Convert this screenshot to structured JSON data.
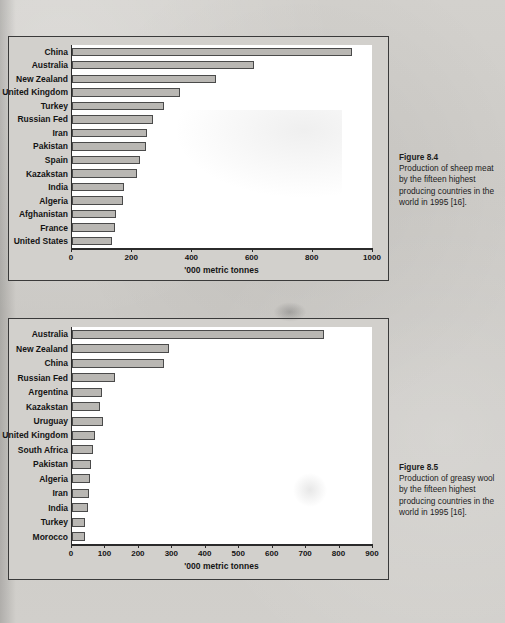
{
  "page": {
    "background_color": "#cfcdc9",
    "bar_fill_color": "#b9b7b3",
    "bar_border_color": "#4a4a4a",
    "axis_color": "#2b2b2b"
  },
  "figures": [
    {
      "id": "fig84",
      "caption_title": "Figure 8.4",
      "caption_text": "Production of sheep meat by the fifteen highest producing countries in the world in 1995 [16].",
      "chart_data": {
        "type": "bar",
        "orientation": "horizontal",
        "title": "",
        "xlabel": "'000 metric tonnes",
        "ylabel": "",
        "xlim": [
          0,
          1000
        ],
        "xticks": [
          0,
          200,
          400,
          600,
          800,
          1000
        ],
        "grid": false,
        "legend": "none",
        "categories": [
          "China",
          "Australia",
          "New Zealand",
          "United Kingdom",
          "Turkey",
          "Russian Fed",
          "Iran",
          "Pakistan",
          "Spain",
          "Kazakstan",
          "India",
          "Algeria",
          "Afghanistan",
          "France",
          "United States"
        ],
        "values": [
          930,
          605,
          478,
          358,
          305,
          270,
          248,
          245,
          225,
          215,
          172,
          170,
          147,
          142,
          132
        ]
      }
    },
    {
      "id": "fig85",
      "caption_title": "Figure 8.5",
      "caption_text": "Production of greasy wool by the fifteen highest producing countries in the world in 1995 [16].",
      "chart_data": {
        "type": "bar",
        "orientation": "horizontal",
        "title": "",
        "xlabel": "'000 metric tonnes",
        "ylabel": "",
        "xlim": [
          0,
          900
        ],
        "xticks": [
          0,
          100,
          200,
          300,
          400,
          500,
          600,
          700,
          800,
          900
        ],
        "grid": false,
        "legend": "none",
        "categories": [
          "Australia",
          "New Zealand",
          "China",
          "Russian Fed",
          "Argentina",
          "Kazakstan",
          "Uruguay",
          "United Kingdom",
          "South Africa",
          "Pakistan",
          "Algeria",
          "Iran",
          "India",
          "Turkey",
          "Morocco"
        ],
        "values": [
          753,
          290,
          275,
          128,
          90,
          85,
          92,
          68,
          62,
          57,
          53,
          52,
          47,
          38,
          38
        ]
      }
    }
  ]
}
